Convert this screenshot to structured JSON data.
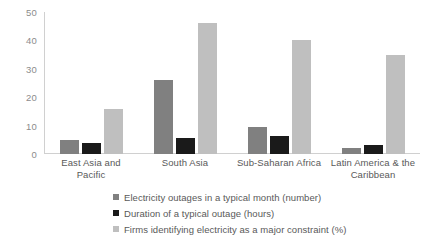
{
  "chart_data": {
    "type": "bar",
    "title": "",
    "xlabel": "",
    "ylabel": "",
    "ylim": [
      0,
      50
    ],
    "yticks": [
      50,
      40,
      30,
      20,
      10,
      0
    ],
    "grid": false,
    "legend_position": "bottom",
    "categories": [
      "East Asia and Pacific",
      "South Asia",
      "Sub-Saharan Africa",
      "Latin America & the Caribbean"
    ],
    "series": [
      {
        "name": "Electricity outages in a typical month (number)",
        "color": "#808080",
        "values": [
          5,
          26,
          9.5,
          2
        ]
      },
      {
        "name": "Duration of a typical outage (hours)",
        "color": "#1a1a1a",
        "values": [
          4,
          5.5,
          6.5,
          3
        ]
      },
      {
        "name": "Firms identifying electricity as a major constraint (%)",
        "color": "#bfbfbf",
        "values": [
          16,
          46,
          40,
          35
        ]
      }
    ]
  },
  "axis": {
    "tick_labels": [
      "50",
      "40",
      "30",
      "20",
      "10",
      "0"
    ]
  },
  "colors": {
    "series_1": "#808080",
    "series_2": "#1a1a1a",
    "series_3": "#bfbfbf",
    "axis_line": "#d0d0d0",
    "tick_text": "#8c8c8c",
    "label_text": "#595959",
    "background": "#ffffff"
  }
}
